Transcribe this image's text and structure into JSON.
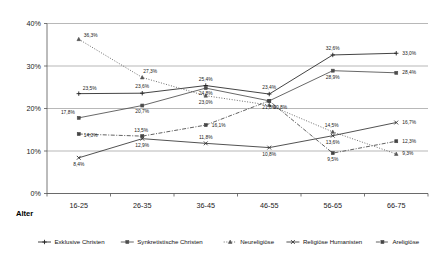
{
  "chart_data": {
    "type": "line",
    "title": "",
    "xlabel": "Alter",
    "ylabel": "",
    "categories": [
      "16-25",
      "26-35",
      "36-45",
      "46-55",
      "56-65",
      "66-75"
    ],
    "ylim": [
      0,
      40
    ],
    "yticks": [
      "0%",
      "10%",
      "20%",
      "30%",
      "40%"
    ],
    "ytick_values": [
      0,
      10,
      20,
      30,
      40
    ],
    "grid": true,
    "legend_position": "bottom",
    "value_suffix": "%",
    "decimal_separator": ",",
    "series": [
      {
        "name": "Exklusive Christen",
        "marker": "plus",
        "dash": "solid",
        "color": "#222222",
        "values": [
          23.5,
          23.6,
          25.4,
          23.4,
          32.6,
          33.0
        ],
        "labels": [
          "23,5%",
          "23,6%",
          "25,4%",
          "23,4%",
          "32,6%",
          "33,0%"
        ]
      },
      {
        "name": "Synkretistische Christen",
        "marker": "square",
        "dash": "solid",
        "color": "#4d4d4d",
        "values": [
          17.8,
          20.7,
          24.8,
          21.8,
          28.9,
          28.4
        ],
        "labels": [
          "17,8%",
          "20,7%",
          "24,8%",
          "21,8%",
          "28,9%",
          "28,4%"
        ]
      },
      {
        "name": "Neureligiöse",
        "marker": "triangle",
        "dash": "dotted",
        "color": "#555555",
        "values": [
          36.3,
          27.3,
          23.0,
          20.8,
          14.5,
          9.3
        ],
        "labels": [
          "36,3%",
          "27,3%",
          "23,0%",
          "20,8%",
          "14,5%",
          "9,3%"
        ]
      },
      {
        "name": "Religiöse Humanisten",
        "marker": "cross",
        "dash": "solid",
        "color": "#333333",
        "values": [
          8.4,
          12.9,
          11.8,
          10.8,
          13.6,
          16.7
        ],
        "labels": [
          "8,4%",
          "12,9%",
          "11,8%",
          "10,8%",
          "13,6%",
          "16,7%"
        ]
      },
      {
        "name": "Areligiöse",
        "marker": "square",
        "dash": "dashdot",
        "color": "#444444",
        "values": [
          14.0,
          13.5,
          16.1,
          21.8,
          9.5,
          12.3
        ],
        "labels": [
          "14,0%",
          "13,5%",
          "16,1%",
          "21,8%",
          "9,5%",
          "12,3%"
        ]
      }
    ]
  },
  "legend": {
    "items": [
      {
        "label": "Exklusive Christen"
      },
      {
        "label": "Synkretistische Christen"
      },
      {
        "label": "Neureligiöse"
      },
      {
        "label": "Religiöse Humanisten"
      },
      {
        "label": "Areligiöse"
      }
    ]
  },
  "axis": {
    "x_title": "Alter"
  }
}
